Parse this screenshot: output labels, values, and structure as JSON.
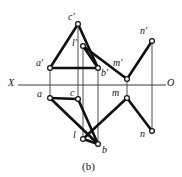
{
  "figure": {
    "caption": "(b)",
    "axis": {
      "left_label": "X",
      "right_label": "O"
    },
    "colors": {
      "stroke": "#101010",
      "thin_stroke": "#3a3a3a",
      "marker_fill": "#ffffff",
      "background": "#ffffff",
      "text": "#111111"
    },
    "point_labels": {
      "c_prime": "c'",
      "l_prime": "l'",
      "a_prime": "a'",
      "b_prime": "b'",
      "m_prime": "m'",
      "n_prime": "n'",
      "a": "a",
      "c": "c",
      "m": "m",
      "n": "n",
      "l": "l",
      "b": "b"
    }
  },
  "chart_data": {
    "type": "diagram",
    "title": "(b)",
    "subtitle": "",
    "xlabel": "X",
    "ylabel": "",
    "grid": false,
    "legend": "none",
    "axis_line": {
      "name": "X-O ground line",
      "x_start": 18,
      "x_end": 166,
      "y": 85,
      "left_label": "X",
      "right_label": "O"
    },
    "points": [
      {
        "id": "c_prime",
        "label": "c'",
        "x": 78,
        "y": 24,
        "label_x": 68,
        "label_y": 12,
        "view": "frontal"
      },
      {
        "id": "n_prime",
        "label": "n'",
        "x": 152,
        "y": 41,
        "label_x": 140,
        "label_y": 26,
        "view": "frontal"
      },
      {
        "id": "l_prime",
        "label": "l'",
        "x": 83,
        "y": 46,
        "label_x": 72,
        "label_y": 38,
        "view": "frontal"
      },
      {
        "id": "a_prime",
        "label": "a'",
        "x": 50,
        "y": 68,
        "label_x": 37,
        "label_y": 58,
        "view": "frontal"
      },
      {
        "id": "b_prime",
        "label": "b'",
        "x": 98,
        "y": 68,
        "label_x": 101,
        "label_y": 68,
        "view": "frontal"
      },
      {
        "id": "m_prime",
        "label": "m'",
        "x": 127,
        "y": 79,
        "label_x": 114,
        "label_y": 58,
        "view": "frontal"
      },
      {
        "id": "a",
        "label": "a",
        "x": 50,
        "y": 98,
        "label_x": 38,
        "label_y": 89,
        "view": "horizontal"
      },
      {
        "id": "c",
        "label": "c",
        "x": 78,
        "y": 99,
        "label_x": 70,
        "label_y": 88,
        "view": "horizontal"
      },
      {
        "id": "m",
        "label": "m",
        "x": 127,
        "y": 98,
        "label_x": 112,
        "label_y": 88,
        "view": "horizontal"
      },
      {
        "id": "n",
        "label": "n",
        "x": 152,
        "y": 131,
        "label_x": 140,
        "label_y": 130,
        "view": "horizontal"
      },
      {
        "id": "l",
        "label": "l",
        "x": 83,
        "y": 139,
        "label_x": 72,
        "label_y": 130,
        "view": "horizontal"
      },
      {
        "id": "b",
        "label": "b",
        "x": 98,
        "y": 144,
        "label_x": 102,
        "label_y": 145,
        "view": "horizontal"
      }
    ],
    "thick_segments": [
      {
        "from": "a_prime",
        "to": "c_prime"
      },
      {
        "from": "c_prime",
        "to": "b_prime"
      },
      {
        "from": "a_prime",
        "to": "b_prime"
      },
      {
        "from": "l_prime",
        "to": "b_prime"
      },
      {
        "from": "l_prime",
        "to": "m_prime"
      },
      {
        "from": "m_prime",
        "to": "n_prime"
      },
      {
        "from": "a",
        "to": "c"
      },
      {
        "from": "c",
        "to": "b"
      },
      {
        "from": "a",
        "to": "b"
      },
      {
        "from": "l",
        "to": "b"
      },
      {
        "from": "l",
        "to": "m"
      },
      {
        "from": "m",
        "to": "n"
      }
    ],
    "projector_lines": [
      {
        "name": "a-projector",
        "x": 50,
        "y_top": 68,
        "y_bottom": 98
      },
      {
        "name": "c-projector",
        "x": 78,
        "y_top": 24,
        "y_bottom": 99
      },
      {
        "name": "l-projector",
        "x": 83,
        "y_top": 46,
        "y_bottom": 139
      },
      {
        "name": "b-projector",
        "x": 98,
        "y_top": 68,
        "y_bottom": 144
      },
      {
        "name": "m-projector",
        "x": 127,
        "y_top": 79,
        "y_bottom": 98
      },
      {
        "name": "n-projector",
        "x": 152,
        "y_top": 41,
        "y_bottom": 131
      }
    ]
  }
}
